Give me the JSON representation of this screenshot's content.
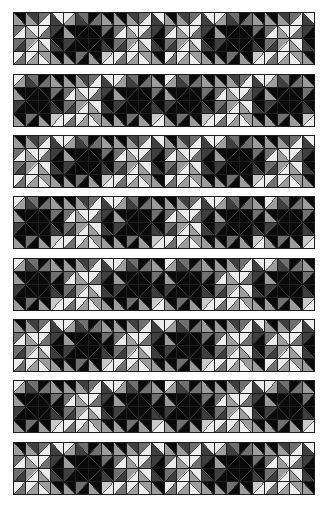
{
  "palette": {
    "K": "#0a0a0a",
    "D": "#3e3e3e",
    "M": "#6f6f6f",
    "G": "#9c9c9c",
    "L": "#c8c8c8",
    "W": "#ececec",
    "grid": "#1e1e1e"
  },
  "templates": {
    "P": [
      [
        [
          "\\",
          "K",
          "G"
        ],
        [
          "\\",
          "D",
          "G"
        ],
        [
          "/",
          "M",
          "W"
        ],
        [
          "\\",
          "W",
          "D"
        ]
      ],
      [
        [
          "/",
          "M",
          "W"
        ],
        [
          "\\",
          "W",
          "G"
        ],
        [
          "/",
          "W",
          "M"
        ],
        [
          "/",
          "D",
          "K"
        ]
      ],
      [
        [
          "/",
          "M",
          "D"
        ],
        [
          "/",
          "G",
          "W"
        ],
        [
          "\\",
          "W",
          "G"
        ],
        [
          "\\",
          "K",
          "D"
        ]
      ],
      [
        [
          "/",
          "W",
          "M"
        ],
        [
          "/",
          "W",
          "G"
        ],
        [
          "\\",
          "G",
          "W"
        ],
        [
          "\\",
          "K",
          "G"
        ]
      ]
    ],
    "X": [
      [
        [
          "/",
          "W",
          "G"
        ],
        [
          "\\",
          "M",
          "D"
        ],
        [
          "/",
          "K",
          "M"
        ],
        [
          "\\",
          "K",
          "G"
        ]
      ],
      [
        [
          "\\",
          "K",
          "G"
        ],
        [
          "/",
          "K",
          "K"
        ],
        [
          "\\",
          "K",
          "K"
        ],
        [
          "/",
          "M",
          "K"
        ]
      ],
      [
        [
          "/",
          "D",
          "K"
        ],
        [
          "\\",
          "K",
          "K"
        ],
        [
          "/",
          "K",
          "K"
        ],
        [
          "\\",
          "K",
          "D"
        ]
      ],
      [
        [
          "\\",
          "K",
          "G"
        ],
        [
          "/",
          "M",
          "K"
        ],
        [
          "\\",
          "K",
          "G"
        ],
        [
          "/",
          "L",
          "W"
        ]
      ]
    ]
  },
  "strips": [
    {
      "top": 12,
      "blocks": [
        "P",
        "X",
        "P",
        "P",
        "X",
        "P"
      ]
    },
    {
      "top": 74,
      "blocks": [
        "X",
        "P",
        "X",
        "X",
        "P",
        "X"
      ]
    },
    {
      "top": 135,
      "blocks": [
        "P",
        "X",
        "P",
        "P",
        "X",
        "P"
      ]
    },
    {
      "top": 196,
      "blocks": [
        "X",
        "P",
        "X",
        "P",
        "X",
        "X"
      ]
    },
    {
      "top": 258,
      "blocks": [
        "X",
        "P",
        "X",
        "X",
        "P",
        "X"
      ]
    },
    {
      "top": 319,
      "blocks": [
        "P",
        "X",
        "P",
        "X",
        "P",
        "P"
      ]
    },
    {
      "top": 380,
      "blocks": [
        "X",
        "P",
        "X",
        "X",
        "P",
        "X"
      ]
    },
    {
      "top": 442,
      "blocks": [
        "P",
        "X",
        "P",
        "P",
        "X",
        "P"
      ]
    }
  ]
}
